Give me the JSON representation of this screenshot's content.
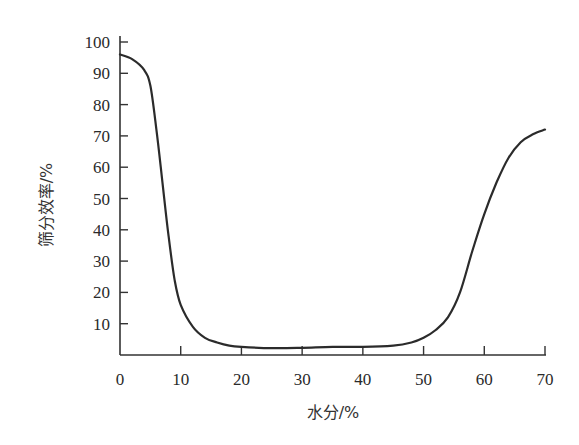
{
  "chart_data": {
    "type": "line",
    "title": "",
    "xlabel": "水分/%",
    "ylabel": "筛分效率/%",
    "xlim": [
      0,
      70
    ],
    "ylim": [
      0,
      100
    ],
    "grid": false,
    "legend": null,
    "x_ticks": [
      0,
      10,
      20,
      30,
      40,
      50,
      60,
      70
    ],
    "y_ticks": [
      10,
      20,
      30,
      40,
      50,
      60,
      70,
      80,
      90,
      100
    ],
    "series": [
      {
        "name": "筛分效率",
        "x": [
          0,
          2,
          4,
          5,
          6,
          7,
          8,
          9,
          10,
          12,
          14,
          16,
          18,
          20,
          25,
          30,
          35,
          40,
          45,
          48,
          50,
          52,
          54,
          56,
          58,
          60,
          62,
          64,
          66,
          68,
          70
        ],
        "y": [
          96,
          94.5,
          91,
          86,
          72,
          55,
          38,
          24,
          16,
          9,
          5.5,
          4,
          3,
          2.6,
          2.2,
          2.3,
          2.6,
          2.6,
          3,
          4,
          5.5,
          8,
          12,
          20,
          33,
          45,
          55,
          63,
          68,
          70.5,
          72
        ]
      }
    ],
    "colors": {
      "line": "#2b2b2b",
      "axis": "#333333"
    }
  }
}
